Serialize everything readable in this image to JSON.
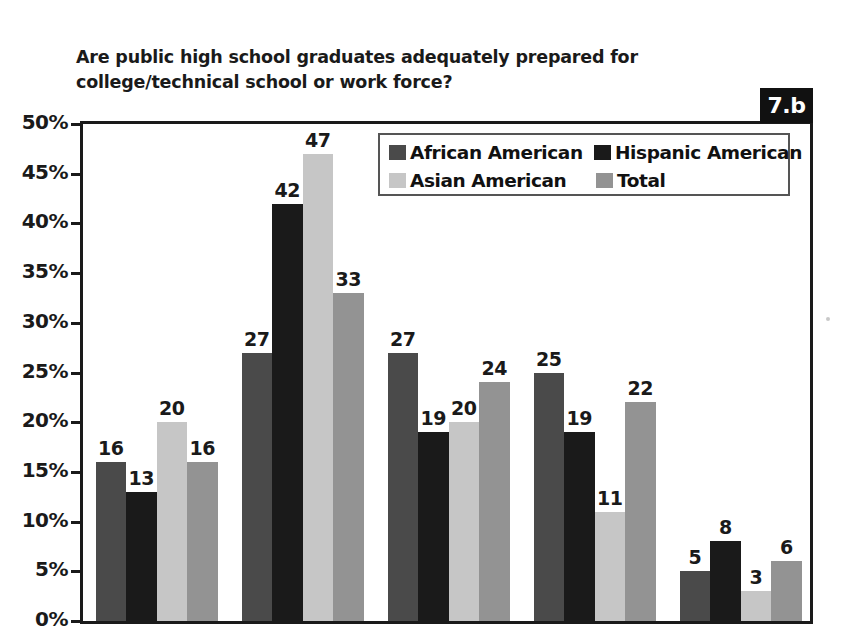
{
  "figure": {
    "badge_label": "7.b",
    "title": "Are public high school graduates adequately prepared for college/technical school or work force?",
    "title_line1": "Are public high school graduates adequately prepared for college/technical",
    "title_line2": "school or work force?"
  },
  "colors": {
    "african_american": "#4a4a4a",
    "hispanic_american": "#1a1a1a",
    "asian_american": "#c6c6c6",
    "total": "#939393",
    "axis": "#1a1a1a",
    "badge_background": "#111111",
    "badge_text": "#ffffff",
    "plot_background": "#ffffff"
  },
  "legend": {
    "position": "inside-top-right",
    "entries": [
      {
        "label": "African American",
        "color": "#4a4a4a",
        "icon": "legend-swatch-icon"
      },
      {
        "label": "Hispanic American",
        "color": "#1a1a1a",
        "icon": "legend-swatch-icon"
      },
      {
        "label": "Asian American",
        "color": "#c6c6c6",
        "icon": "legend-swatch-icon"
      },
      {
        "label": "Total",
        "color": "#939393",
        "icon": "legend-swatch-icon"
      }
    ]
  },
  "yaxis": {
    "ticks": [
      "50%",
      "45%",
      "40%",
      "35%",
      "30%",
      "25%",
      "20%",
      "15%",
      "10%",
      "5%",
      "0%"
    ],
    "min": 0,
    "max": 50,
    "step": 5
  },
  "chart_data": {
    "type": "bar",
    "title": "Are public high school graduates adequately prepared for college/technical school or work force?",
    "xlabel": "",
    "ylabel": "",
    "ylim": [
      0,
      50
    ],
    "ytick_labels": [
      "0%",
      "5%",
      "10%",
      "15%",
      "20%",
      "25%",
      "30%",
      "35%",
      "40%",
      "45%",
      "50%"
    ],
    "grid": false,
    "legend_position": "inside-top-right",
    "value_labels": true,
    "note": "x-axis category labels are cropped out of the screenshot below the 0% baseline",
    "categories": [
      "",
      "",
      "",
      "",
      ""
    ],
    "series": [
      {
        "name": "African American",
        "color": "#4a4a4a",
        "values": [
          16,
          27,
          27,
          25,
          5
        ]
      },
      {
        "name": "Hispanic American",
        "color": "#1a1a1a",
        "values": [
          13,
          42,
          19,
          19,
          8
        ]
      },
      {
        "name": "Asian American",
        "color": "#c6c6c6",
        "values": [
          20,
          47,
          20,
          11,
          3
        ]
      },
      {
        "name": "Total",
        "color": "#939393",
        "values": [
          16,
          33,
          24,
          22,
          6
        ]
      }
    ]
  }
}
